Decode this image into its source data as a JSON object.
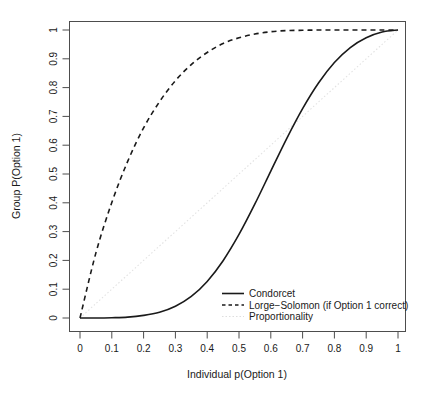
{
  "chart_data": {
    "type": "line",
    "title": "",
    "xlabel": "Individual p(Option 1)",
    "ylabel": "Group P(Option 1)",
    "xlim": [
      0,
      1
    ],
    "ylim": [
      0,
      1
    ],
    "grid": false,
    "legend_position": "bottom-right",
    "x_ticks": [
      "0",
      "0.1",
      "0.2",
      "0.3",
      "0.4",
      "0.5",
      "0.6",
      "0.7",
      "0.8",
      "0.9",
      "1"
    ],
    "y_ticks": [
      "0",
      "0.1",
      "0.2",
      "0.3",
      "0.4",
      "0.5",
      "0.6",
      "0.7",
      "0.8",
      "0.9",
      "1"
    ],
    "x": [
      0,
      0.05,
      0.1,
      0.15,
      0.2,
      0.25,
      0.3,
      0.35,
      0.4,
      0.45,
      0.5,
      0.55,
      0.6,
      0.65,
      0.7,
      0.75,
      0.8,
      0.85,
      0.9,
      0.95,
      1
    ],
    "series": [
      {
        "name": "Condorcet",
        "style": "solid",
        "color": "#1a1a1a",
        "values": [
          0.0,
          0.0,
          0.001,
          0.003,
          0.009,
          0.02,
          0.041,
          0.075,
          0.127,
          0.199,
          0.29,
          0.396,
          0.51,
          0.623,
          0.727,
          0.816,
          0.887,
          0.939,
          0.973,
          0.993,
          1.0
        ]
      },
      {
        "name": "Lorge−Solomon (if Option 1 correct)",
        "style": "dashed",
        "color": "#1a1a1a",
        "values": [
          0.0,
          0.226,
          0.401,
          0.544,
          0.66,
          0.751,
          0.824,
          0.88,
          0.922,
          0.953,
          0.973,
          0.986,
          0.994,
          0.998,
          0.999,
          1.0,
          1.0,
          1.0,
          1.0,
          1.0,
          1.0
        ]
      },
      {
        "name": "Proportionality",
        "style": "dotted",
        "color": "#e2e2e2",
        "values": [
          0,
          0.05,
          0.1,
          0.15,
          0.2,
          0.25,
          0.3,
          0.35,
          0.4,
          0.45,
          0.5,
          0.55,
          0.6,
          0.65,
          0.7,
          0.75,
          0.8,
          0.85,
          0.9,
          0.95,
          1
        ]
      }
    ]
  }
}
